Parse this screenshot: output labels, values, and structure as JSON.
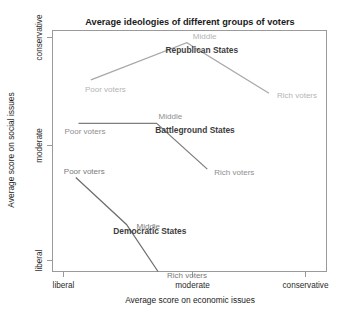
{
  "chart_data": {
    "type": "line",
    "title": "Average ideologies of different groups of voters",
    "xlabel": "Average score on economic issues",
    "ylabel": "Average score on social issues",
    "x_ticks": [
      "liberal",
      "moderate",
      "conservative"
    ],
    "y_ticks": [
      "conservative",
      "moderate",
      "liberal"
    ],
    "xlim": [
      "liberal",
      "conservative"
    ],
    "ylim": [
      "liberal",
      "conservative"
    ],
    "grid": false,
    "legend": "none",
    "categories": [
      "Poor voters",
      "Middle",
      "Rich voters"
    ],
    "series": [
      {
        "name": "Republican States",
        "color": "#a8a8a8",
        "label_color": "#b4b4b4",
        "points": [
          {
            "label": "Poor voters",
            "x": 0.14,
            "y": 0.795
          },
          {
            "label": "Middle",
            "x": 0.49,
            "y": 0.95
          },
          {
            "label": "Rich voters",
            "x": 0.79,
            "y": 0.74
          }
        ]
      },
      {
        "name": "Battleground States",
        "color": "#7e7e7e",
        "label_color": "#8e8e8e",
        "points": [
          {
            "label": "Poor voters",
            "x": 0.095,
            "y": 0.615
          },
          {
            "label": "Middle",
            "x": 0.38,
            "y": 0.615
          },
          {
            "label": "Rich voters",
            "x": 0.565,
            "y": 0.425
          }
        ]
      },
      {
        "name": "Democratic States",
        "color": "#6e6e6e",
        "label_color": "#7a7a7a",
        "points": [
          {
            "label": "Poor voters",
            "x": 0.085,
            "y": 0.39
          },
          {
            "label": "Middle",
            "x": 0.27,
            "y": 0.195
          },
          {
            "label": "Rich voters",
            "x": 0.385,
            "y": 0.0
          }
        ]
      }
    ],
    "group_labels": [
      {
        "text": "Republican States",
        "x": 0.545,
        "y": 0.905
      },
      {
        "text": "Battleground States",
        "x": 0.52,
        "y": 0.575
      },
      {
        "text": "Democratic States",
        "x": 0.355,
        "y": 0.155
      }
    ]
  }
}
